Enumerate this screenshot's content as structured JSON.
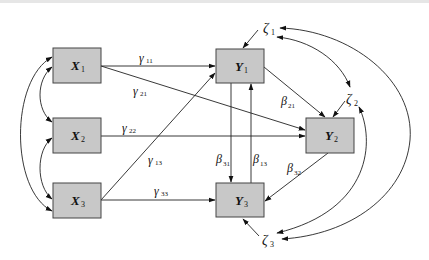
{
  "diagram": {
    "type": "structural-equation-path-diagram",
    "colors": {
      "box_fill": "#c8c8c8",
      "box_stroke": "#444444",
      "line": "#222222",
      "background": "#ffffff"
    },
    "nodes": {
      "X1": {
        "symbol": "X",
        "sub": "1"
      },
      "X2": {
        "symbol": "X",
        "sub": "2"
      },
      "X3": {
        "symbol": "X",
        "sub": "3"
      },
      "Y1": {
        "symbol": "Y",
        "sub": "1"
      },
      "Y2": {
        "symbol": "Y",
        "sub": "2"
      },
      "Y3": {
        "symbol": "Y",
        "sub": "3"
      }
    },
    "errors": {
      "z1": {
        "symbol": "ζ",
        "sub": "1"
      },
      "z2": {
        "symbol": "ζ",
        "sub": "2"
      },
      "z3": {
        "symbol": "ζ",
        "sub": "3"
      }
    },
    "paths": {
      "g11": {
        "symbol": "γ",
        "sub": "11",
        "from": "X1",
        "to": "Y1"
      },
      "g21": {
        "symbol": "γ",
        "sub": "21",
        "from": "X1",
        "to": "Y2"
      },
      "g22": {
        "symbol": "γ",
        "sub": "22",
        "from": "X2",
        "to": "Y2"
      },
      "g13": {
        "symbol": "γ",
        "sub": "13",
        "from": "X3",
        "to": "Y1"
      },
      "g33": {
        "symbol": "γ",
        "sub": "33",
        "from": "X3",
        "to": "Y3"
      },
      "b21": {
        "symbol": "β",
        "sub": "21",
        "from": "Y1",
        "to": "Y2"
      },
      "b31": {
        "symbol": "β",
        "sub": "31",
        "from": "Y1",
        "to": "Y3"
      },
      "b13": {
        "symbol": "β",
        "sub": "13",
        "from": "Y3",
        "to": "Y1"
      },
      "b32": {
        "symbol": "β",
        "sub": "32",
        "from": "Y2",
        "to": "Y3"
      }
    },
    "covariances": [
      {
        "between": [
          "X1",
          "X2"
        ]
      },
      {
        "between": [
          "X2",
          "X3"
        ]
      },
      {
        "between": [
          "X1",
          "X3"
        ]
      },
      {
        "between": [
          "ζ1",
          "ζ2"
        ]
      },
      {
        "between": [
          "ζ1",
          "ζ3"
        ]
      },
      {
        "between": [
          "ζ2",
          "ζ3"
        ]
      }
    ]
  }
}
